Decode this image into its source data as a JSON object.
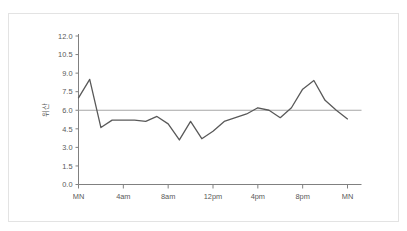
{
  "card": {
    "background_color": "#ffffff",
    "border_color": "#e3e3e3"
  },
  "title_text": "",
  "chart_data": {
    "type": "line",
    "title": "",
    "subtitle": "",
    "xlabel": "",
    "ylabel": "위산",
    "ylim": [
      0.0,
      12.0
    ],
    "yticks": [
      0.0,
      1.5,
      3.0,
      4.5,
      6.0,
      7.5,
      9.0,
      10.5,
      12.0
    ],
    "ytick_labels": [
      "0.0",
      "1.5",
      "3.0",
      "4.5",
      "6.0",
      "7.5",
      "9.0",
      "10.5",
      "12.0"
    ],
    "xlim": [
      0,
      24
    ],
    "xticks": [
      0,
      4,
      8,
      12,
      16,
      20,
      24
    ],
    "xtick_labels": [
      "MN",
      "4am",
      "8am",
      "12pm",
      "4pm",
      "8pm",
      "MN"
    ],
    "grid": false,
    "legend": null,
    "legend_position": "none",
    "line_color": "#595959",
    "line_width": 1.3,
    "reference_line": {
      "value": 6.0,
      "color": "#a6a6a6",
      "width": 1.1,
      "label": ""
    },
    "x": [
      0,
      1,
      2,
      3,
      4,
      5,
      6,
      7,
      8,
      9,
      10,
      11,
      12,
      13,
      14,
      15,
      16,
      17,
      18,
      19,
      20,
      21,
      22,
      23,
      24
    ],
    "series": [
      {
        "name": "위산",
        "values": [
          7.0,
          8.5,
          4.6,
          5.2,
          5.2,
          5.2,
          5.1,
          5.5,
          4.9,
          3.6,
          5.1,
          3.7,
          4.3,
          5.1,
          5.4,
          5.7,
          6.2,
          6.0,
          5.4,
          6.2,
          7.7,
          8.4,
          6.8,
          6.0,
          5.3
        ]
      }
    ]
  },
  "axis": {
    "axis_color": "#808080",
    "tick_color": "#808080",
    "label_color": "#595959"
  }
}
